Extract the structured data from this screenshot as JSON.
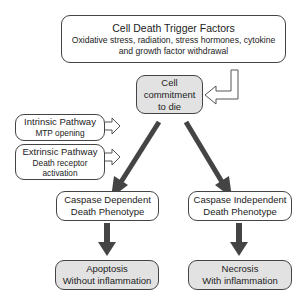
{
  "diagram": {
    "trigger": {
      "title": "Cell Death Trigger Factors",
      "line1": "Oxidative stress, radiation, stress hormones, cytokine",
      "line2": "and growth factor withdrawal"
    },
    "commitment": {
      "line1": "Cell",
      "line2": "commitment",
      "line3": "to die"
    },
    "intrinsic": {
      "title": "Intrinsic Pathway",
      "detail": "MTP opening"
    },
    "extrinsic": {
      "title": "Extrinsic Pathway",
      "detail1": "Death receptor",
      "detail2": "activation"
    },
    "caspase_dependent": {
      "line1": "Caspase Dependent",
      "line2": "Death Phenotype"
    },
    "caspase_independent": {
      "line1": "Caspase Independent",
      "line2": "Death Phenotype"
    },
    "apoptosis": {
      "title": "Apoptosis",
      "detail": "Without inflammation"
    },
    "necrosis": {
      "title": "Necrosis",
      "detail": "With inflammation"
    },
    "colors": {
      "box_border": "#444444",
      "gray_fill": "#e2e2e2",
      "arrow": "#444444"
    }
  }
}
